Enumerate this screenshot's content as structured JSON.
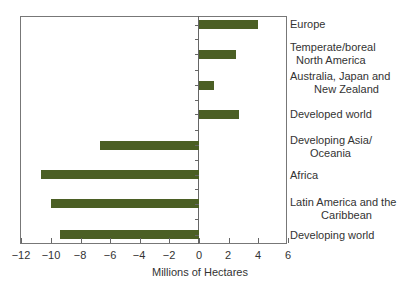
{
  "chart_data": {
    "type": "bar",
    "orientation": "horizontal",
    "title": "",
    "xlabel": "Millions of Hectares",
    "ylabel": "",
    "xlim": [
      -12,
      6
    ],
    "x_ticks": [
      "-12",
      "-10",
      "-8",
      "-6",
      "-4",
      "-2",
      "0",
      "2",
      "4",
      "6"
    ],
    "grid": false,
    "legend": null,
    "bar_color": "#4b5f24",
    "categories": [
      "Europe",
      "Temperate/boreal North America",
      "Australia, Japan and New Zealand",
      "Developed world",
      "Developing Asia/ Oceania",
      "Africa",
      "Latin America and the Caribbean",
      "Developing world"
    ],
    "values": [
      4.0,
      2.5,
      1.0,
      2.7,
      -6.7,
      -10.7,
      -10.0,
      -9.4
    ]
  },
  "labels": {
    "cat0": {
      "l1": "Europe",
      "l2": ""
    },
    "cat1": {
      "l1": "Temperate/boreal",
      "l2": "North America"
    },
    "cat2": {
      "l1": "Australia, Japan and",
      "l2": "New Zealand"
    },
    "cat3": {
      "l1": "Developed world",
      "l2": ""
    },
    "cat4": {
      "l1": "Developing Asia/",
      "l2": "Oceania"
    },
    "cat5": {
      "l1": "Africa",
      "l2": ""
    },
    "cat6": {
      "l1": "Latin America and the",
      "l2": "Caribbean"
    },
    "cat7": {
      "l1": "Developing world",
      "l2": ""
    }
  },
  "xticks": {
    "t0": "−12",
    "t1": "−10",
    "t2": "−8",
    "t3": "−6",
    "t4": "−4",
    "t5": "−2",
    "t6": "0",
    "t7": "2",
    "t8": "4",
    "t9": "6"
  },
  "axis_title": "Millions of Hectares"
}
